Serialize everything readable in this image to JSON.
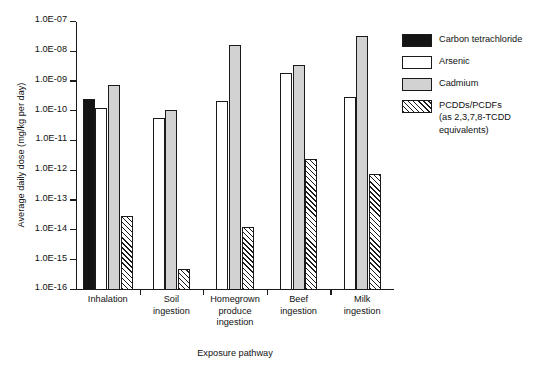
{
  "chart_data": {
    "type": "bar",
    "title": "",
    "xlabel": "Exposure pathway",
    "ylabel": "Average daily dose (mg/kg per day)",
    "yscale": "log",
    "ylim": [
      1e-16,
      1e-07
    ],
    "grid": false,
    "legend_position": "right",
    "ytick_labels": [
      "1.0E-07",
      "1.0E-08",
      "1.0E-09",
      "1.0E-10",
      "1.0E-11",
      "1.0E-12",
      "1.0E-13",
      "1.0E-14",
      "1.0E-15",
      "1.0E-16"
    ],
    "ytick_values": [
      1e-07,
      1e-08,
      1e-09,
      1e-10,
      1e-11,
      1e-12,
      1e-13,
      1e-14,
      1e-15,
      1e-16
    ],
    "categories": [
      "Inhalation",
      "Soil ingestion",
      "Homegrown produce ingestion",
      "Beef ingestion",
      "Milk ingestion"
    ],
    "category_lines": [
      [
        "Inhalation"
      ],
      [
        "Soil",
        "ingestion"
      ],
      [
        "Homegrown",
        "produce",
        "ingestion"
      ],
      [
        "Beef",
        "ingestion"
      ],
      [
        "Milk",
        "ingestion"
      ]
    ],
    "series": [
      {
        "name": "Carbon tetrachloride",
        "fill": "solid-black",
        "color": "#141414",
        "values": [
          2.5e-10,
          null,
          null,
          null,
          null
        ]
      },
      {
        "name": "Arsenic",
        "fill": "white",
        "color": "#ffffff",
        "values": [
          1.3e-10,
          6e-11,
          2.2e-10,
          2e-09,
          3e-10
        ]
      },
      {
        "name": "Cadmium",
        "fill": "light-gray",
        "color": "#d2d2d2",
        "values": [
          7.5e-10,
          1.1e-10,
          1.7e-08,
          3.5e-09,
          3.3e-08
        ]
      },
      {
        "name": "PCDDs/PCDFs",
        "name_sub": "(as 2,3,7,8-TCDD equivalents)",
        "fill": "diagonal-hatch",
        "color": "#ffffff",
        "values": [
          3e-14,
          5e-16,
          1.3e-14,
          2.5e-12,
          8e-13
        ]
      }
    ]
  },
  "legend": {
    "items": [
      {
        "label": "Carbon tetrachloride",
        "sub": ""
      },
      {
        "label": "Arsenic",
        "sub": ""
      },
      {
        "label": "Cadmium",
        "sub": ""
      },
      {
        "label": "PCDDs/PCDFs",
        "sub_line1": "(as 2,3,7,8-TCDD",
        "sub_line2": "equivalents)"
      }
    ]
  }
}
